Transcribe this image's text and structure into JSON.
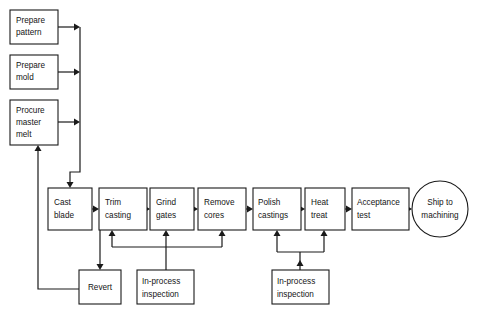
{
  "diagram": {
    "type": "flowchart",
    "background_color": "#ffffff",
    "line_color": "#1a1a1a",
    "text_color": "#141414",
    "nodes": [
      {
        "id": "prepare-pattern",
        "shape": "rect",
        "lines": [
          "Prepare",
          "pattern"
        ],
        "x": 10,
        "y": 10,
        "w": 48,
        "h": 34
      },
      {
        "id": "prepare-mold",
        "shape": "rect",
        "lines": [
          "Prepare",
          "mold"
        ],
        "x": 10,
        "y": 55,
        "w": 48,
        "h": 34
      },
      {
        "id": "procure-master-melt",
        "shape": "rect",
        "lines": [
          "Procure",
          "master",
          "melt"
        ],
        "x": 10,
        "y": 100,
        "w": 48,
        "h": 45
      },
      {
        "id": "cast-blade",
        "shape": "rect",
        "lines": [
          "Cast",
          "blade"
        ],
        "x": 48,
        "y": 188,
        "w": 44,
        "h": 42
      },
      {
        "id": "trim-casting",
        "shape": "rect",
        "lines": [
          "Trim",
          "casting"
        ],
        "x": 99,
        "y": 188,
        "w": 48,
        "h": 42
      },
      {
        "id": "grind-gates",
        "shape": "rect",
        "lines": [
          "Grind",
          "gates"
        ],
        "x": 150,
        "y": 188,
        "w": 44,
        "h": 42
      },
      {
        "id": "remove-cores",
        "shape": "rect",
        "lines": [
          "Remove",
          "cores"
        ],
        "x": 198,
        "y": 188,
        "w": 48,
        "h": 42
      },
      {
        "id": "polish-castings",
        "shape": "rect",
        "lines": [
          "Polish",
          "castings"
        ],
        "x": 253,
        "y": 188,
        "w": 48,
        "h": 42
      },
      {
        "id": "heat-treat",
        "shape": "rect",
        "lines": [
          "Heat",
          "treat"
        ],
        "x": 305,
        "y": 188,
        "w": 40,
        "h": 42
      },
      {
        "id": "acceptance-test",
        "shape": "rect",
        "lines": [
          "Acceptance",
          "test"
        ],
        "x": 352,
        "y": 188,
        "w": 57,
        "h": 42
      },
      {
        "id": "ship-to-machining",
        "shape": "circle",
        "lines": [
          "Ship to",
          "machining"
        ],
        "cx": 440,
        "cy": 209,
        "r": 28
      },
      {
        "id": "revert",
        "shape": "rect",
        "lines": [
          "Revert"
        ],
        "x": 79,
        "y": 270,
        "w": 42,
        "h": 34
      },
      {
        "id": "in-process-inspection-left",
        "shape": "rect",
        "lines": [
          "In-process",
          "inspection"
        ],
        "x": 137,
        "y": 270,
        "w": 57,
        "h": 34
      },
      {
        "id": "in-process-inspection-right",
        "shape": "rect",
        "lines": [
          "In-process",
          "inspection"
        ],
        "x": 272,
        "y": 270,
        "w": 57,
        "h": 34
      }
    ],
    "edges": [
      {
        "id": "edge-prepare-pattern-to-bus",
        "from": "prepare-pattern",
        "to": "input-bus",
        "label": ""
      },
      {
        "id": "edge-prepare-mold-to-bus",
        "from": "prepare-mold",
        "to": "input-bus",
        "label": ""
      },
      {
        "id": "edge-procure-master-melt-to-bus",
        "from": "procure-master-melt",
        "to": "input-bus",
        "label": ""
      },
      {
        "id": "edge-bus-to-cast-blade",
        "from": "input-bus",
        "to": "cast-blade",
        "label": ""
      },
      {
        "id": "edge-cast-blade-to-trim-casting",
        "from": "cast-blade",
        "to": "trim-casting",
        "label": ""
      },
      {
        "id": "edge-trim-casting-to-grind-gates",
        "from": "trim-casting",
        "to": "grind-gates",
        "label": ""
      },
      {
        "id": "edge-grind-gates-to-remove-cores",
        "from": "grind-gates",
        "to": "remove-cores",
        "label": ""
      },
      {
        "id": "edge-remove-cores-to-polish",
        "from": "remove-cores",
        "to": "polish-castings",
        "label": ""
      },
      {
        "id": "edge-polish-to-heat-treat",
        "from": "polish-castings",
        "to": "heat-treat",
        "label": ""
      },
      {
        "id": "edge-heat-treat-to-acceptance",
        "from": "heat-treat",
        "to": "acceptance-test",
        "label": ""
      },
      {
        "id": "edge-acceptance-to-ship",
        "from": "acceptance-test",
        "to": "ship-to-machining",
        "label": ""
      },
      {
        "id": "edge-trim-casting-to-revert",
        "from": "trim-casting",
        "to": "revert",
        "label": ""
      },
      {
        "id": "edge-revert-to-procure-master-melt",
        "from": "revert",
        "to": "procure-master-melt",
        "label": ""
      },
      {
        "id": "edge-inspection-left-to-trim",
        "from": "in-process-inspection-left",
        "to": "trim-casting",
        "label": ""
      },
      {
        "id": "edge-inspection-left-to-grind",
        "from": "in-process-inspection-left",
        "to": "grind-gates",
        "label": ""
      },
      {
        "id": "edge-inspection-left-to-remove",
        "from": "in-process-inspection-left",
        "to": "remove-cores",
        "label": ""
      },
      {
        "id": "edge-inspection-right-to-polish",
        "from": "in-process-inspection-right",
        "to": "polish-castings",
        "label": ""
      },
      {
        "id": "edge-inspection-right-to-heat",
        "from": "in-process-inspection-right",
        "to": "heat-treat",
        "label": ""
      }
    ]
  }
}
